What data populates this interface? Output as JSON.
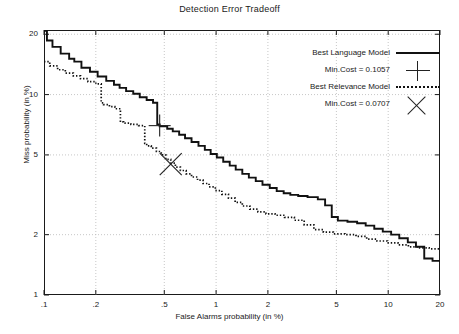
{
  "chart_data": {
    "type": "line",
    "title": "Detection Error Tradeoff",
    "xlabel": "False Alarms probability (in %)",
    "ylabel": "Miss probability (in %)",
    "scale": "log-log",
    "grid": true,
    "xlim": [
      0.1,
      20
    ],
    "ylim": [
      1,
      21
    ],
    "xticks": [
      ".1",
      ".2",
      ".5",
      "1",
      "2",
      "5",
      "10",
      "20"
    ],
    "xtick_values": [
      0.1,
      0.2,
      0.5,
      1,
      2,
      5,
      10,
      20
    ],
    "yticks": [
      "20",
      "10",
      "5",
      "2",
      "1"
    ],
    "ytick_values": [
      20,
      10,
      5,
      2,
      1
    ],
    "legend_position": "top-right",
    "series": [
      {
        "name": "Best Language Model",
        "style": "solid",
        "color": "#111111",
        "points": [
          [
            0.1,
            20.8
          ],
          [
            0.104,
            20.8
          ],
          [
            0.104,
            18.6
          ],
          [
            0.112,
            18.6
          ],
          [
            0.112,
            17.3
          ],
          [
            0.125,
            17.3
          ],
          [
            0.125,
            16.0
          ],
          [
            0.14,
            16.0
          ],
          [
            0.14,
            15.1
          ],
          [
            0.15,
            15.1
          ],
          [
            0.15,
            14.6
          ],
          [
            0.165,
            14.6
          ],
          [
            0.165,
            13.6
          ],
          [
            0.185,
            13.6
          ],
          [
            0.185,
            13.0
          ],
          [
            0.205,
            13.0
          ],
          [
            0.205,
            12.3
          ],
          [
            0.23,
            12.3
          ],
          [
            0.23,
            11.7
          ],
          [
            0.255,
            11.7
          ],
          [
            0.255,
            11.2
          ],
          [
            0.275,
            11.2
          ],
          [
            0.275,
            10.8
          ],
          [
            0.3,
            10.8
          ],
          [
            0.3,
            10.4
          ],
          [
            0.33,
            10.4
          ],
          [
            0.33,
            10.1
          ],
          [
            0.36,
            10.1
          ],
          [
            0.36,
            9.7
          ],
          [
            0.395,
            9.7
          ],
          [
            0.395,
            9.4
          ],
          [
            0.43,
            9.4
          ],
          [
            0.43,
            9.1
          ],
          [
            0.455,
            9.1
          ],
          [
            0.455,
            7.1
          ],
          [
            0.47,
            7.1
          ],
          [
            0.47,
            6.95
          ],
          [
            0.52,
            6.95
          ],
          [
            0.52,
            6.75
          ],
          [
            0.56,
            6.75
          ],
          [
            0.56,
            6.55
          ],
          [
            0.61,
            6.55
          ],
          [
            0.61,
            6.3
          ],
          [
            0.66,
            6.3
          ],
          [
            0.66,
            6.05
          ],
          [
            0.72,
            6.05
          ],
          [
            0.72,
            5.8
          ],
          [
            0.79,
            5.8
          ],
          [
            0.79,
            5.55
          ],
          [
            0.86,
            5.55
          ],
          [
            0.86,
            5.3
          ],
          [
            0.93,
            5.3
          ],
          [
            0.93,
            5.05
          ],
          [
            1.01,
            5.05
          ],
          [
            1.01,
            4.85
          ],
          [
            1.1,
            4.85
          ],
          [
            1.1,
            4.62
          ],
          [
            1.2,
            4.62
          ],
          [
            1.2,
            4.42
          ],
          [
            1.3,
            4.42
          ],
          [
            1.3,
            4.22
          ],
          [
            1.42,
            4.22
          ],
          [
            1.42,
            4.02
          ],
          [
            1.55,
            4.02
          ],
          [
            1.55,
            3.85
          ],
          [
            1.7,
            3.85
          ],
          [
            1.7,
            3.7
          ],
          [
            1.86,
            3.7
          ],
          [
            1.86,
            3.55
          ],
          [
            2.05,
            3.55
          ],
          [
            2.05,
            3.42
          ],
          [
            2.25,
            3.42
          ],
          [
            2.25,
            3.3
          ],
          [
            2.47,
            3.3
          ],
          [
            2.47,
            3.22
          ],
          [
            2.7,
            3.22
          ],
          [
            2.7,
            3.16
          ],
          [
            3.0,
            3.16
          ],
          [
            3.0,
            3.12
          ],
          [
            3.4,
            3.12
          ],
          [
            3.4,
            3.08
          ],
          [
            3.9,
            3.08
          ],
          [
            3.9,
            3.0
          ],
          [
            4.3,
            3.0
          ],
          [
            4.3,
            2.8
          ],
          [
            4.7,
            2.8
          ],
          [
            4.7,
            2.45
          ],
          [
            5.1,
            2.45
          ],
          [
            5.1,
            2.35
          ],
          [
            5.8,
            2.35
          ],
          [
            5.8,
            2.32
          ],
          [
            6.6,
            2.32
          ],
          [
            6.6,
            2.28
          ],
          [
            7.4,
            2.28
          ],
          [
            7.4,
            2.22
          ],
          [
            8.3,
            2.22
          ],
          [
            8.3,
            2.14
          ],
          [
            9.3,
            2.14
          ],
          [
            9.3,
            2.07
          ],
          [
            10.4,
            2.07
          ],
          [
            10.4,
            2.0
          ],
          [
            11.6,
            2.0
          ],
          [
            11.6,
            1.92
          ],
          [
            13.0,
            1.92
          ],
          [
            13.0,
            1.83
          ],
          [
            14.5,
            1.83
          ],
          [
            14.5,
            1.74
          ],
          [
            16.2,
            1.74
          ],
          [
            16.2,
            1.52
          ],
          [
            18.1,
            1.52
          ],
          [
            18.1,
            1.48
          ],
          [
            20.0,
            1.48
          ]
        ]
      },
      {
        "name": "Best Relevance Model",
        "style": "dotted",
        "color": "#111111",
        "points": [
          [
            0.1,
            14.6
          ],
          [
            0.108,
            14.6
          ],
          [
            0.108,
            13.9
          ],
          [
            0.12,
            13.9
          ],
          [
            0.12,
            13.3
          ],
          [
            0.133,
            13.3
          ],
          [
            0.133,
            12.8
          ],
          [
            0.148,
            12.8
          ],
          [
            0.148,
            12.4
          ],
          [
            0.163,
            12.4
          ],
          [
            0.163,
            12.0
          ],
          [
            0.18,
            12.0
          ],
          [
            0.18,
            11.6
          ],
          [
            0.2,
            11.6
          ],
          [
            0.2,
            11.3
          ],
          [
            0.215,
            11.3
          ],
          [
            0.215,
            9.1
          ],
          [
            0.222,
            9.1
          ],
          [
            0.222,
            8.9
          ],
          [
            0.24,
            8.9
          ],
          [
            0.24,
            8.7
          ],
          [
            0.258,
            8.7
          ],
          [
            0.258,
            8.5
          ],
          [
            0.278,
            8.5
          ],
          [
            0.278,
            7.3
          ],
          [
            0.29,
            7.3
          ],
          [
            0.29,
            7.2
          ],
          [
            0.32,
            7.2
          ],
          [
            0.32,
            7.1
          ],
          [
            0.355,
            7.1
          ],
          [
            0.355,
            7.0
          ],
          [
            0.385,
            7.0
          ],
          [
            0.385,
            5.7
          ],
          [
            0.395,
            5.7
          ],
          [
            0.395,
            5.55
          ],
          [
            0.42,
            5.55
          ],
          [
            0.42,
            5.4
          ],
          [
            0.45,
            5.4
          ],
          [
            0.45,
            5.2
          ],
          [
            0.48,
            5.2
          ],
          [
            0.48,
            5.0
          ],
          [
            0.51,
            5.0
          ],
          [
            0.51,
            4.75
          ],
          [
            0.545,
            4.75
          ],
          [
            0.545,
            4.55
          ],
          [
            0.58,
            4.55
          ],
          [
            0.58,
            4.35
          ],
          [
            0.62,
            4.35
          ],
          [
            0.62,
            4.18
          ],
          [
            0.67,
            4.18
          ],
          [
            0.67,
            4.02
          ],
          [
            0.72,
            4.02
          ],
          [
            0.72,
            3.88
          ],
          [
            0.78,
            3.88
          ],
          [
            0.78,
            3.74
          ],
          [
            0.84,
            3.74
          ],
          [
            0.84,
            3.6
          ],
          [
            0.91,
            3.6
          ],
          [
            0.91,
            3.46
          ],
          [
            0.99,
            3.46
          ],
          [
            0.99,
            3.32
          ],
          [
            1.08,
            3.32
          ],
          [
            1.08,
            3.18
          ],
          [
            1.18,
            3.18
          ],
          [
            1.18,
            3.04
          ],
          [
            1.29,
            3.04
          ],
          [
            1.29,
            2.9
          ],
          [
            1.42,
            2.9
          ],
          [
            1.42,
            2.78
          ],
          [
            1.57,
            2.78
          ],
          [
            1.57,
            2.68
          ],
          [
            1.75,
            2.68
          ],
          [
            1.75,
            2.6
          ],
          [
            1.95,
            2.6
          ],
          [
            1.95,
            2.54
          ],
          [
            2.2,
            2.54
          ],
          [
            2.2,
            2.5
          ],
          [
            2.5,
            2.5
          ],
          [
            2.5,
            2.44
          ],
          [
            2.85,
            2.44
          ],
          [
            2.85,
            2.36
          ],
          [
            3.25,
            2.36
          ],
          [
            3.25,
            2.24
          ],
          [
            3.7,
            2.24
          ],
          [
            3.7,
            2.12
          ],
          [
            4.2,
            2.12
          ],
          [
            4.2,
            2.06
          ],
          [
            4.8,
            2.06
          ],
          [
            4.8,
            2.02
          ],
          [
            5.6,
            2.02
          ],
          [
            5.6,
            2.0
          ],
          [
            6.5,
            2.0
          ],
          [
            6.5,
            1.96
          ],
          [
            7.5,
            1.96
          ],
          [
            7.5,
            1.9
          ],
          [
            8.6,
            1.9
          ],
          [
            8.6,
            1.86
          ],
          [
            9.9,
            1.86
          ],
          [
            9.9,
            1.82
          ],
          [
            11.4,
            1.82
          ],
          [
            11.4,
            1.78
          ],
          [
            13.1,
            1.78
          ],
          [
            13.1,
            1.74
          ],
          [
            15.0,
            1.74
          ],
          [
            15.0,
            1.72
          ],
          [
            17.3,
            1.72
          ],
          [
            17.3,
            1.7
          ],
          [
            20.0,
            1.7
          ]
        ]
      }
    ],
    "markers": [
      {
        "name": "Min.Cost = 0.1057",
        "shape": "plus",
        "series": "Best Language Model",
        "x": 0.47,
        "y": 7.0,
        "value": 0.1057
      },
      {
        "name": "Min.Cost = 0.0707",
        "shape": "x",
        "series": "Best Relevance Model",
        "x": 0.545,
        "y": 4.5,
        "value": 0.0707
      }
    ]
  },
  "legend": {
    "entries": [
      {
        "label": "Best Language Model",
        "marker": "solid-line"
      },
      {
        "label": "Min.Cost = 0.1057",
        "marker": "plus-marker"
      },
      {
        "label": "Best Relevance Model",
        "marker": "dotted-line"
      },
      {
        "label": "Min.Cost = 0.0707",
        "marker": "x-marker"
      }
    ]
  },
  "colors": {
    "curve": "#111111",
    "grid": "#b9b9b9",
    "axis": "#1a1a1a",
    "background": "#ffffff"
  }
}
